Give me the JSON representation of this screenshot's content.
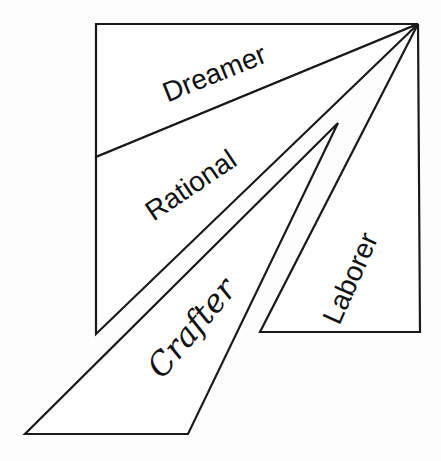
{
  "diagram": {
    "type": "temperament-wedge-diagram",
    "apex": [
      418,
      24
    ],
    "regions": [
      {
        "id": "dreamer",
        "label": "Dreamer",
        "points": "96,24 418,24 96,157",
        "label_pos": [
          218,
          82
        ],
        "label_rotate": -22
      },
      {
        "id": "rational",
        "label": "Rational",
        "points": "96,157 418,24 96,334",
        "label_pos": [
          196,
          193
        ],
        "label_rotate": -34
      },
      {
        "id": "crafter",
        "label": "Crafter",
        "points": "338,123 25,434 188,434",
        "label_pos": [
          200,
          335
        ],
        "label_rotate": -50
      },
      {
        "id": "laborer",
        "label": "Laborer",
        "points": "418,24 260,332 420,332",
        "label_pos": [
          359,
          282
        ],
        "label_rotate": -66
      }
    ],
    "colors": {
      "stroke": "#1a1a1a",
      "fill": "#ffffff",
      "text": "#111111",
      "background": "#fdfdfd"
    }
  }
}
